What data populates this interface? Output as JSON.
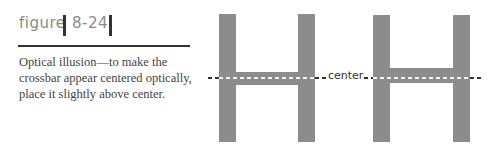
{
  "figure": {
    "label": "figure",
    "number": "8-24"
  },
  "caption": "Optical illusion—to make the crossbar appear centered optically, place it slightly above center.",
  "illustration": {
    "letters": [
      "H",
      "H"
    ],
    "letter_color": "#8c8c8c",
    "center_line_label": "center",
    "left_h": "crossbar mathematically centered on the center line",
    "right_h": "crossbar placed slightly above center line"
  }
}
